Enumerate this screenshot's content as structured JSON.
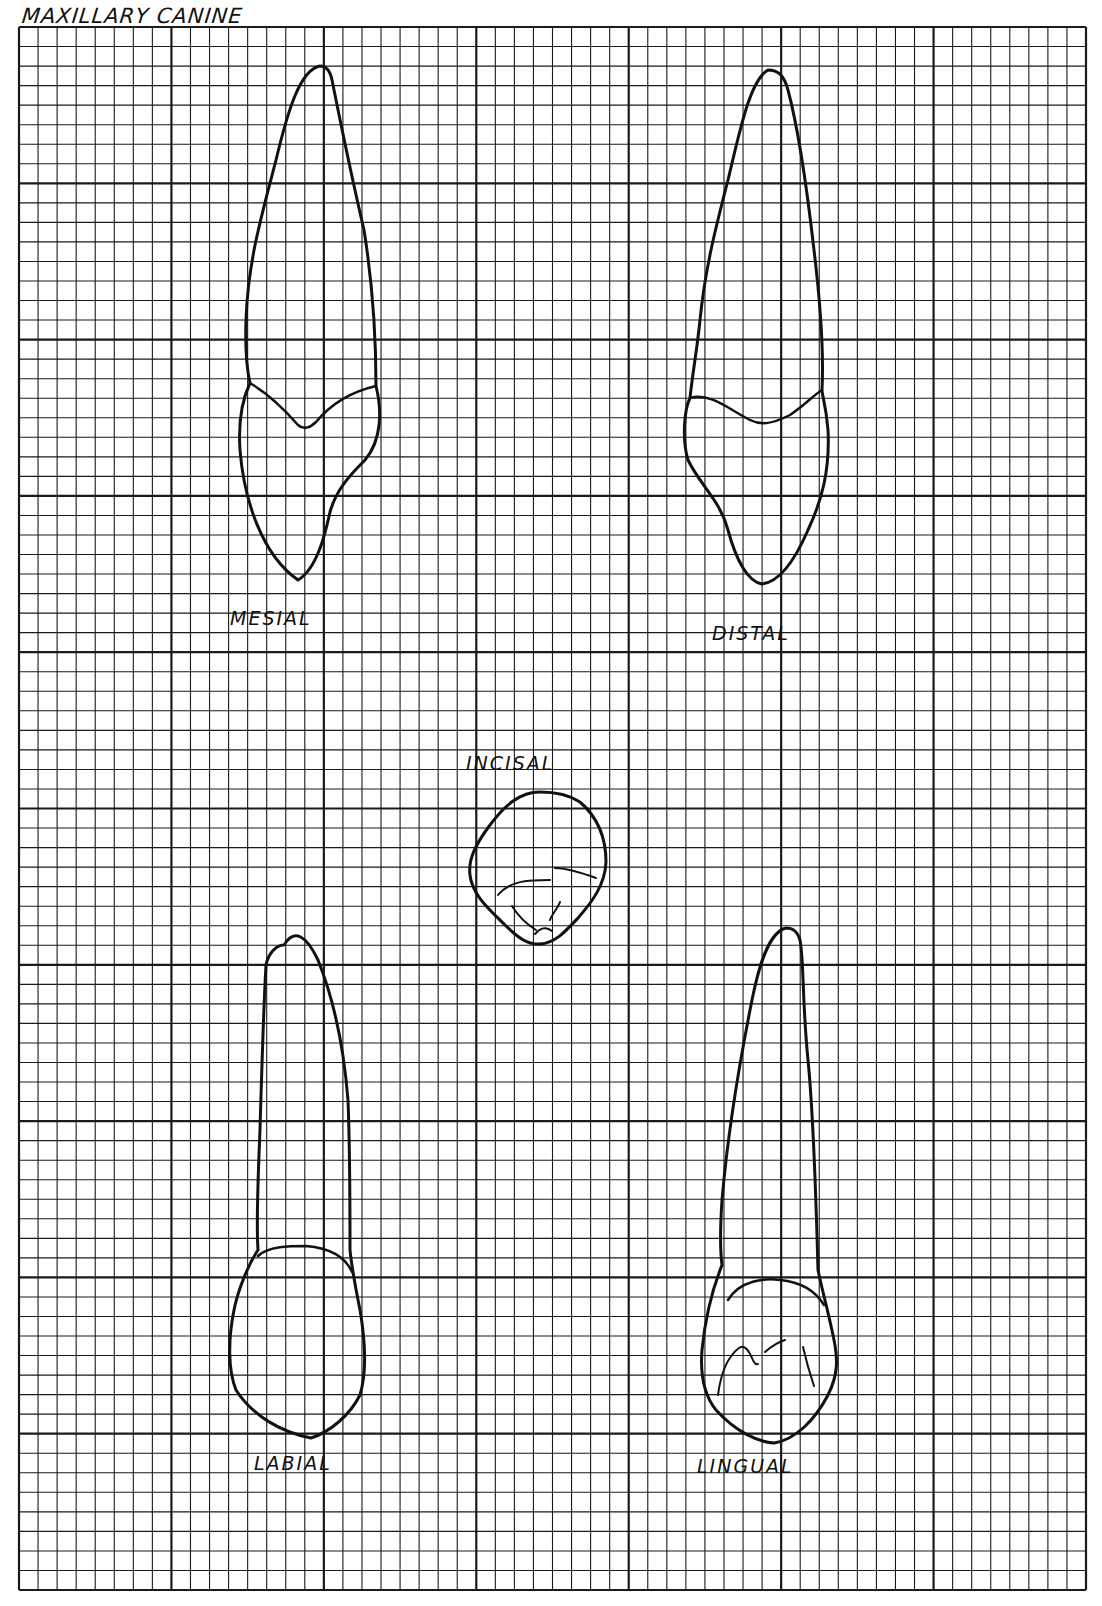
{
  "title": "MAXILLARY CANINE",
  "grid": {
    "left": 19,
    "top": 27,
    "right": 1086,
    "bottom": 1590,
    "columns": 56,
    "rows": 80,
    "major_every": 8,
    "line_color": "#1a1a1a"
  },
  "views": [
    {
      "id": "mesial",
      "label": "MESIAL",
      "x": 230,
      "y": 607
    },
    {
      "id": "distal",
      "label": "DISTAL",
      "x": 712,
      "y": 622
    },
    {
      "id": "incisal",
      "label": "INCISAL",
      "x": 466,
      "y": 752
    },
    {
      "id": "labial",
      "label": "LABIAL",
      "x": 254,
      "y": 1452
    },
    {
      "id": "lingual",
      "label": "LINGUAL",
      "x": 697,
      "y": 1455
    }
  ],
  "colors": {
    "ink": "#111111",
    "paper": "#ffffff"
  }
}
